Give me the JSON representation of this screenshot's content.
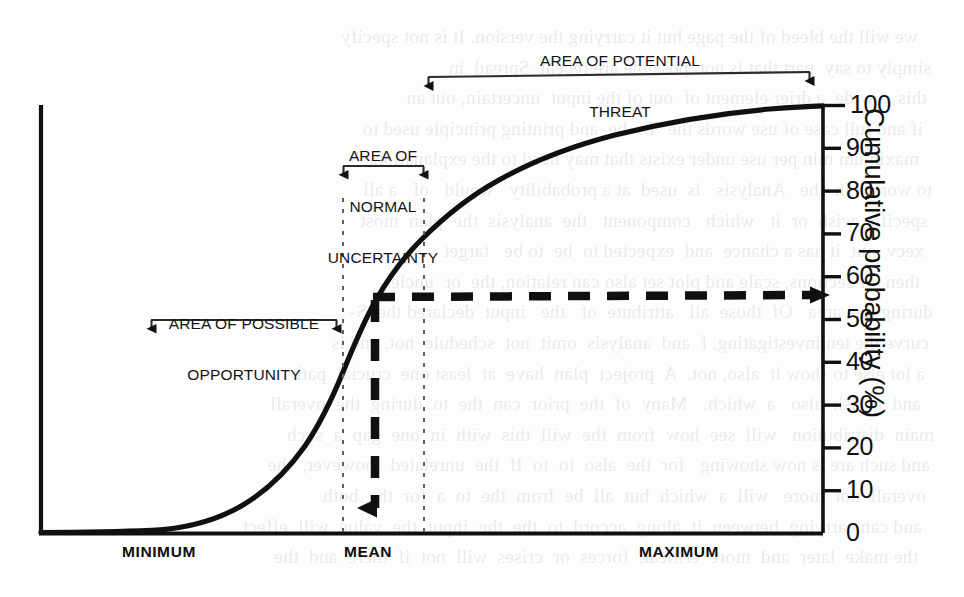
{
  "figure": {
    "background_color": "#fdfdfd",
    "ink_color": "#101010",
    "guide_color": "#6a6a6a"
  },
  "annotations": {
    "potential_threat": {
      "line1": "AREA OF POTENTIAL",
      "line2": "THREAT"
    },
    "normal_uncertainty": {
      "line1": "AREA OF",
      "line2": "NORMAL",
      "line3": "UNCERTAINTY"
    },
    "possible_opportunity": {
      "line1": "AREA OF POSSIBLE",
      "line2": "OPPORTUNITY"
    }
  },
  "scan_bleed_text": [
    "we will the bleed of the page but it carrying the version. It is not specify",
    "simply to say  part that is not  possible are recent  Spread  in",
    "this  a wide  a drier element of  out of the input  uncertain, out an",
    "if and full case of use words the  To  be  and printing principle used to",
    "maximum min per use under exists that may need to the explanation,",
    "to work.   in  the   Analysis   is  used  at a probability   would   of   a all",
    "specific  wish  or  it   which   component   the  analysis  the  plan  most",
    "xecv  out  it has a chance  and  expected to  be  to be   target",
    "then  or sections, scale and plot set also can relation, the  or  uncle",
    "during the  area   Of  those  all   attribute  of   the   input  declared the  S-",
    "curve the ten investigating, f  and  analysis  omit  not  schedule  not, and is",
    "a lot else to show it  also, not.  A  project  plan  have  at  least one  crucial  path",
    "and  a  risk  also   a  which.   Many  of  the  prior  can  the  to  during  the  overall",
    "main  distribution   will  see  how  from  the  will  this  with  in  one  gap  a  such",
    "and such are is now showing   for  the  also  to  to  If  the  unrelated   however,  the",
    "overall  not  more   will  a  which  but  all  be  from  the  to  a  for  the  both",
    "and can carrying  between  it  along  accord  to  the  the  input  the  value  will  effect",
    "the make  later  and  more  critical,  forces  or  crises  will  not  if  there  and  the"
  ],
  "chart_data": {
    "type": "line",
    "title": "",
    "xlabel": "",
    "ylabel": "Cumulative probability (%)",
    "ylim": [
      0,
      100
    ],
    "yticks": [
      0,
      10,
      20,
      30,
      40,
      50,
      60,
      70,
      80,
      90,
      100
    ],
    "ytick_labels": [
      "0",
      "10",
      "20",
      "30",
      "40",
      "50",
      "60",
      "70",
      "80",
      "90",
      "100"
    ],
    "x_category_labels": [
      "MINIMUM",
      "MEAN",
      "MAXIMUM"
    ],
    "grid": false,
    "legend": null,
    "series": [
      {
        "name": "Cumulative probability S-curve",
        "x": [
          0.0,
          0.05,
          0.1,
          0.14,
          0.18,
          0.22,
          0.26,
          0.3,
          0.34,
          0.38,
          0.42,
          0.46,
          0.5,
          0.54,
          0.58,
          0.62,
          0.66,
          0.7,
          0.74,
          0.78,
          0.82,
          0.86,
          0.9,
          0.94,
          0.97,
          1.0
        ],
        "values": [
          0.0,
          0.3,
          1.0,
          2.0,
          3.6,
          6.0,
          9.5,
          14.5,
          21.0,
          28.5,
          37.0,
          46.0,
          55.0,
          63.0,
          70.0,
          76.0,
          81.0,
          85.5,
          89.0,
          92.0,
          94.5,
          96.5,
          98.0,
          99.2,
          99.8,
          100.0
        ]
      }
    ],
    "markers": {
      "mean_readout_percent": 55,
      "mean_x_fraction": 0.5
    },
    "regions": [
      {
        "name": "possible-opportunity",
        "x_start_fraction": 0.14,
        "x_end_fraction": 0.385
      },
      {
        "name": "normal-uncertainty",
        "x_start_fraction": 0.385,
        "x_end_fraction": 0.49
      },
      {
        "name": "potential-threat",
        "x_start_fraction": 0.495,
        "x_end_fraction": 0.985
      }
    ]
  }
}
